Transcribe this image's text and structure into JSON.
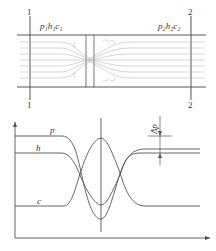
{
  "diagram": {
    "top": {
      "section_1_label_top": "1",
      "section_1_label_bottom": "1",
      "section_2_label_top": "2",
      "section_2_label_bottom": "2",
      "state_1_label": "p₁h₁c₁",
      "state_2_label": "p₂h₂c₂"
    },
    "bottom": {
      "curve_p_label": "p",
      "curve_h_label": "h",
      "curve_c_label": "c",
      "delta_p_label": "Δp"
    },
    "colors": {
      "line": "#555555",
      "streamline": "#aaaaaa"
    }
  }
}
